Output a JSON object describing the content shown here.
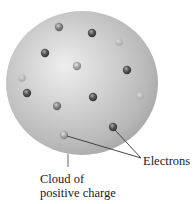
{
  "diagram": {
    "labels": {
      "electrons": "Electrons",
      "cloud_line1": "Cloud of",
      "cloud_line2": "positive charge"
    },
    "colors": {
      "sphere_highlight": "#ececec",
      "sphere_mid": "#c4c4c4",
      "sphere_edge": "#a8a8a8",
      "electron_dark": "#4a4a4a",
      "electron_medium": "#7a7a7a",
      "electron_light": "#a0a0a0",
      "leader_line": "#333333",
      "text": "#1a1a1a"
    },
    "sphere": {
      "cx": 82,
      "cy": 83,
      "rx": 76,
      "ry": 72
    },
    "electrons": [
      {
        "x": 59,
        "y": 27,
        "shade": "medium"
      },
      {
        "x": 92,
        "y": 33,
        "shade": "dark"
      },
      {
        "x": 119,
        "y": 42,
        "shade": "faint"
      },
      {
        "x": 45,
        "y": 53,
        "shade": "dark"
      },
      {
        "x": 77,
        "y": 66,
        "shade": "light"
      },
      {
        "x": 127,
        "y": 70,
        "shade": "dark"
      },
      {
        "x": 22,
        "y": 78,
        "shade": "faint"
      },
      {
        "x": 27,
        "y": 93,
        "shade": "dark"
      },
      {
        "x": 93,
        "y": 97,
        "shade": "dark"
      },
      {
        "x": 140,
        "y": 96,
        "shade": "faint"
      },
      {
        "x": 57,
        "y": 106,
        "shade": "medium"
      },
      {
        "x": 113,
        "y": 127,
        "shade": "dark"
      },
      {
        "x": 64,
        "y": 135,
        "shade": "light"
      }
    ]
  }
}
